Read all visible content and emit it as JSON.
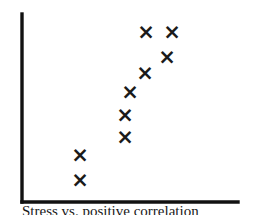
{
  "chart_data": {
    "type": "scatter",
    "title": "",
    "subtitle": "",
    "caption": "Stress vs. positive correlation",
    "xlabel": "",
    "ylabel": "",
    "xlim": [
      0,
      10
    ],
    "ylim": [
      0,
      10
    ],
    "grid": false,
    "legend": null,
    "marker": "x",
    "marker_label": "×",
    "marker_color": "#1a1a1a",
    "axis_color": "#111111",
    "background_color": "#ffffff",
    "relationship": "positive",
    "point_count": 9,
    "points": [
      {
        "x": 2.7,
        "y": 1.2
      },
      {
        "x": 2.7,
        "y": 2.3
      },
      {
        "x": 4.8,
        "y": 3.3
      },
      {
        "x": 4.8,
        "y": 4.3
      },
      {
        "x": 5.2,
        "y": 5.3
      },
      {
        "x": 5.9,
        "y": 6.3
      },
      {
        "x": 6.7,
        "y": 7.0
      },
      {
        "x": 5.9,
        "y": 8.2
      },
      {
        "x": 7.0,
        "y": 8.2
      }
    ],
    "pixel_points": [
      {
        "x": 80,
        "y": 180
      },
      {
        "x": 80,
        "y": 155
      },
      {
        "x": 125,
        "y": 137
      },
      {
        "x": 125,
        "y": 115
      },
      {
        "x": 130,
        "y": 92
      },
      {
        "x": 145,
        "y": 73
      },
      {
        "x": 167,
        "y": 57
      },
      {
        "x": 146,
        "y": 32
      },
      {
        "x": 172,
        "y": 32
      }
    ],
    "axes": {
      "y_axis": {
        "x": 22,
        "y_top": 14,
        "y_bottom": 202
      },
      "x_axis": {
        "y": 202,
        "x_left": 22,
        "x_right": 238
      }
    }
  }
}
